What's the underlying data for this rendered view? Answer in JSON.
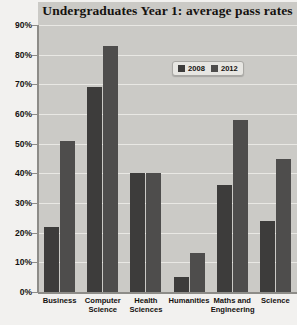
{
  "chart_data": {
    "type": "bar",
    "title": "Undergraduates Year 1: average pass rates",
    "xlabel": "",
    "ylabel": "",
    "ylim": [
      0,
      90
    ],
    "y_tick_labels": [
      "0%",
      "10%",
      "20%",
      "30%",
      "40%",
      "50%",
      "60%",
      "70%",
      "80%",
      "90%"
    ],
    "y_ticks": [
      0,
      10,
      20,
      30,
      40,
      50,
      60,
      70,
      80,
      90
    ],
    "grid": true,
    "legend_position": "top-right",
    "categories": [
      "Business",
      "Computer Science",
      "Health Sciences",
      "Humanities",
      "Maths and Engineering",
      "Science"
    ],
    "series": [
      {
        "name": "2008",
        "color": "#3d3c3b",
        "values": [
          22,
          69,
          40,
          5,
          36,
          24
        ]
      },
      {
        "name": "2012",
        "color": "#4e4d4c",
        "values": [
          51,
          83,
          40,
          13,
          58,
          45
        ]
      }
    ]
  },
  "legend": {
    "items": [
      {
        "label": "2008"
      },
      {
        "label": "2012"
      }
    ]
  }
}
